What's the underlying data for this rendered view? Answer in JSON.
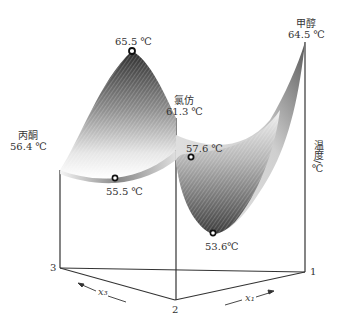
{
  "diagram": {
    "type": "3d-surface",
    "vertical_axis_label": "温度/℃",
    "base_axes": {
      "x1_label": "x₁",
      "x3_label": "x₃",
      "corner_1": "1",
      "corner_2": "2",
      "corner_3": "3"
    },
    "components": [
      {
        "name": "丙酮",
        "temp": "56.4 ℃"
      },
      {
        "name": "氯仿",
        "temp": "61.3 ℃"
      },
      {
        "name": "甲醇",
        "temp": "64.5 ℃"
      }
    ],
    "points": [
      {
        "label": "65.5 ℃",
        "kind": "maximum"
      },
      {
        "label": "55.5 ℃",
        "kind": "saddle-edge"
      },
      {
        "label": "57.6 ℃",
        "kind": "edge-min"
      },
      {
        "label": "53.6℃",
        "kind": "minimum"
      }
    ],
    "colors": {
      "surface_dark": "#3a3a3a",
      "surface_light": "#f2f2f2",
      "lines": "#333333",
      "background": "#ffffff"
    }
  }
}
